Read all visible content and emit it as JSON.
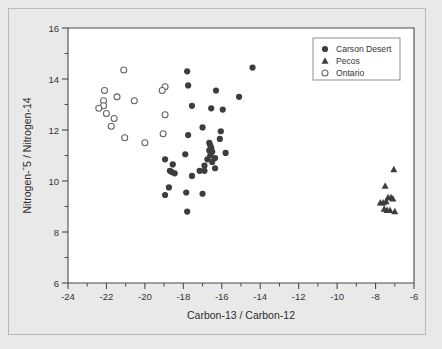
{
  "figure": {
    "background_color": "#e9e9e9",
    "plot_background_color": "#ffffff",
    "border_color": "#b9b9b9"
  },
  "chart_data": {
    "type": "scatter",
    "title": "",
    "xlabel": "Carbon-13 / Carbon-12",
    "ylabel": "Nitrogen-ˉ5 / Nitrogen-14",
    "xlim": [
      -24,
      -6
    ],
    "ylim": [
      6,
      16
    ],
    "xticks": [
      -24,
      -22,
      -20,
      -18,
      -16,
      -14,
      -12,
      -10,
      -8,
      -6
    ],
    "xticklabels": [
      "-24",
      "-22",
      "-20",
      "-18",
      "-16",
      "-14",
      "-12",
      "-10",
      "-8",
      "-6"
    ],
    "xminorticks": [
      -23,
      -21,
      -19,
      -17,
      -15,
      -13,
      -11,
      -9,
      -7
    ],
    "yticks": [
      6,
      8,
      10,
      12,
      14,
      16
    ],
    "yticklabels": [
      "6",
      "8",
      "10",
      "12",
      "14",
      "16"
    ],
    "yminorticks": [
      7,
      9,
      11,
      13,
      15
    ],
    "grid": false,
    "legend_position": "top-right",
    "marker_color": "#3d3d3d",
    "open_marker_edge_color": "#636363",
    "series": [
      {
        "name": "Carson Desert",
        "marker": "filled-circle",
        "color": "#3d3d3d",
        "points": [
          [
            -17.8,
            14.3
          ],
          [
            -14.4,
            14.45
          ],
          [
            -17.75,
            13.75
          ],
          [
            -16.3,
            13.55
          ],
          [
            -15.1,
            13.3
          ],
          [
            -17.55,
            12.95
          ],
          [
            -16.55,
            12.85
          ],
          [
            -15.95,
            12.8
          ],
          [
            -17.0,
            12.1
          ],
          [
            -16.05,
            11.95
          ],
          [
            -17.75,
            11.8
          ],
          [
            -16.1,
            11.65
          ],
          [
            -16.65,
            11.5
          ],
          [
            -16.6,
            11.4
          ],
          [
            -16.55,
            11.3
          ],
          [
            -16.65,
            11.2
          ],
          [
            -16.5,
            11.15
          ],
          [
            -15.8,
            11.1
          ],
          [
            -17.9,
            11.05
          ],
          [
            -16.6,
            11.0
          ],
          [
            -16.35,
            10.9
          ],
          [
            -16.75,
            10.85
          ],
          [
            -18.95,
            10.85
          ],
          [
            -16.5,
            10.75
          ],
          [
            -16.9,
            10.6
          ],
          [
            -18.55,
            10.65
          ],
          [
            -16.35,
            10.5
          ],
          [
            -17.15,
            10.4
          ],
          [
            -18.7,
            10.4
          ],
          [
            -18.6,
            10.35
          ],
          [
            -18.45,
            10.3
          ],
          [
            -17.55,
            10.2
          ],
          [
            -16.9,
            10.4
          ],
          [
            -18.75,
            9.75
          ],
          [
            -17.85,
            9.55
          ],
          [
            -17.0,
            9.5
          ],
          [
            -18.95,
            9.45
          ],
          [
            -17.8,
            8.8
          ]
        ]
      },
      {
        "name": "Pecos",
        "marker": "filled-triangle",
        "color": "#3d3d3d",
        "points": [
          [
            -7.05,
            10.45
          ],
          [
            -7.5,
            9.8
          ],
          [
            -7.35,
            9.35
          ],
          [
            -7.2,
            9.35
          ],
          [
            -7.1,
            9.3
          ],
          [
            -7.75,
            9.15
          ],
          [
            -7.6,
            9.15
          ],
          [
            -7.45,
            9.2
          ],
          [
            -7.55,
            8.9
          ],
          [
            -7.4,
            8.85
          ],
          [
            -7.25,
            8.85
          ],
          [
            -7.0,
            8.8
          ]
        ]
      },
      {
        "name": "Ontario",
        "marker": "open-circle",
        "color": "#ffffff",
        "points": [
          [
            -21.1,
            14.35
          ],
          [
            -22.1,
            13.55
          ],
          [
            -21.45,
            13.3
          ],
          [
            -22.15,
            13.15
          ],
          [
            -22.15,
            12.95
          ],
          [
            -20.55,
            13.15
          ],
          [
            -18.95,
            13.7
          ],
          [
            -19.1,
            13.55
          ],
          [
            -22.4,
            12.85
          ],
          [
            -22.0,
            12.65
          ],
          [
            -21.6,
            12.45
          ],
          [
            -21.75,
            12.15
          ],
          [
            -18.95,
            12.6
          ],
          [
            -21.05,
            11.7
          ],
          [
            -19.05,
            11.85
          ],
          [
            -20.0,
            11.5
          ]
        ]
      }
    ]
  }
}
